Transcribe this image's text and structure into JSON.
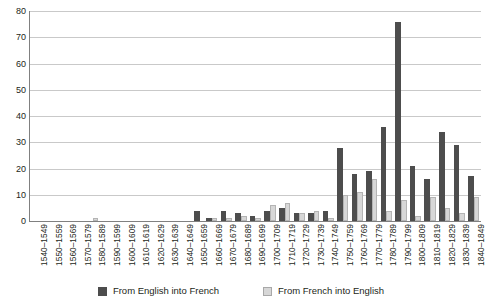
{
  "chart_data": {
    "type": "bar",
    "title": "",
    "subtitle": "",
    "xlabel": "",
    "ylabel": "",
    "ylim": [
      0,
      80
    ],
    "yticks": [
      0,
      10,
      20,
      30,
      40,
      50,
      60,
      70,
      80
    ],
    "grid": true,
    "legend_position": "bottom",
    "categories": [
      "1540–1549",
      "1550–1559",
      "1560–1569",
      "1570–1579",
      "1580–1589",
      "1590–1599",
      "1600–1609",
      "1610–1619",
      "1620–1629",
      "1630–1639",
      "1640–1649",
      "1650–1659",
      "1660–1669",
      "1670–1679",
      "1680–1689",
      "1690–1699",
      "1700–1709",
      "1710–1719",
      "1720–1729",
      "1730–1739",
      "1740–1749",
      "1750–1759",
      "1760–1769",
      "1770–1779",
      "1780–1789",
      "1790–1799",
      "1800–1809",
      "1810–1819",
      "1820–1829",
      "1830–1839",
      "1840–1849"
    ],
    "series": [
      {
        "name": "From English into French",
        "color": "#4d4d4d",
        "values": [
          0,
          0,
          0,
          0,
          0,
          0,
          0,
          0,
          0,
          0,
          0,
          4,
          1,
          4,
          3,
          2,
          4,
          5,
          3,
          3,
          4,
          28,
          18,
          19,
          36,
          76,
          21,
          16,
          34,
          29,
          17
        ]
      },
      {
        "name": "From French into English",
        "color": "#d7d7d7",
        "values": [
          0,
          0,
          0,
          0,
          1,
          0,
          0,
          0,
          0,
          0,
          0,
          0,
          1,
          1,
          2,
          1,
          6,
          7,
          3,
          4,
          1,
          10,
          11,
          16,
          4,
          8,
          2,
          9,
          5,
          3,
          9
        ]
      }
    ]
  },
  "legend": {
    "items": [
      {
        "label": "From English into French",
        "swatch": "dark-square-icon"
      },
      {
        "label": "From French into English",
        "swatch": "light-square-icon"
      }
    ]
  }
}
